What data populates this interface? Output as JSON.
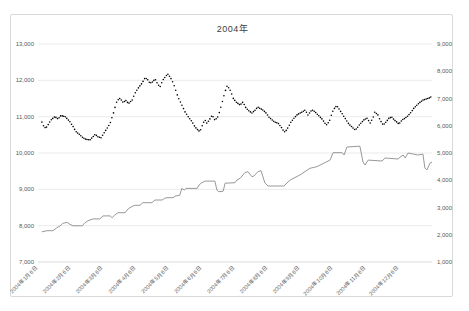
{
  "window": {
    "title": "2004年"
  },
  "colors": {
    "background": "#ffffff",
    "frame_border": "#d9d9d9",
    "gridline": "#e2e2e2",
    "axis_line": "#c8c8c8",
    "axis_text": "#595959",
    "series_black": "#000000",
    "series_gray": "#8c8c8c"
  },
  "chart_data": {
    "type": "line",
    "title": "2004年",
    "legend": "none",
    "grid": "horizontal",
    "x_axis": {
      "labels": [
        "2004年1月6日",
        "2004年2月6日",
        "2004年3月6日",
        "2004年4月6日",
        "2004年5月6日",
        "2004年6月6日",
        "2004年7月6日",
        "2004年8月6日",
        "2004年9月6日",
        "2004年10月6日",
        "2004年11月6日",
        "2004年12月6日"
      ],
      "rotation": -45
    },
    "y_axis_left": {
      "min": 7000,
      "max": 13000,
      "step": 1000,
      "tick_labels": [
        "13,000",
        "12,000",
        "11,000",
        "10,000",
        "9,000",
        "8,000",
        "7,000"
      ]
    },
    "y_axis_right": {
      "min": 1000,
      "max": 9000,
      "step": 1000,
      "tick_labels": [
        "9,000",
        "8,000",
        "7,000",
        "6,000",
        "5,000",
        "4,000",
        "3,000",
        "2,000",
        "1,000"
      ]
    },
    "series": [
      {
        "name": "black-dotted-daily-series",
        "axis": "left",
        "style": "dots",
        "color": "#000000",
        "keypoints": [
          [
            0.01,
            10850
          ],
          [
            0.015,
            10725
          ],
          [
            0.02,
            10680
          ],
          [
            0.033,
            10910
          ],
          [
            0.043,
            11000
          ],
          [
            0.051,
            10935
          ],
          [
            0.058,
            11030
          ],
          [
            0.069,
            11000
          ],
          [
            0.081,
            10860
          ],
          [
            0.089,
            10725
          ],
          [
            0.096,
            10590
          ],
          [
            0.107,
            10495
          ],
          [
            0.114,
            10420
          ],
          [
            0.122,
            10375
          ],
          [
            0.132,
            10360
          ],
          [
            0.14,
            10450
          ],
          [
            0.145,
            10515
          ],
          [
            0.152,
            10450
          ],
          [
            0.16,
            10420
          ],
          [
            0.17,
            10590
          ],
          [
            0.178,
            10725
          ],
          [
            0.183,
            10815
          ],
          [
            0.19,
            11045
          ],
          [
            0.195,
            11230
          ],
          [
            0.198,
            11370
          ],
          [
            0.203,
            11460
          ],
          [
            0.208,
            11505
          ],
          [
            0.216,
            11395
          ],
          [
            0.226,
            11460
          ],
          [
            0.228,
            11340
          ],
          [
            0.239,
            11460
          ],
          [
            0.246,
            11645
          ],
          [
            0.254,
            11780
          ],
          [
            0.264,
            11920
          ],
          [
            0.272,
            12075
          ],
          [
            0.279,
            12010
          ],
          [
            0.284,
            11920
          ],
          [
            0.292,
            11965
          ],
          [
            0.297,
            12040
          ],
          [
            0.305,
            11875
          ],
          [
            0.31,
            11830
          ],
          [
            0.317,
            12010
          ],
          [
            0.327,
            12150
          ],
          [
            0.33,
            12170
          ],
          [
            0.34,
            12010
          ],
          [
            0.348,
            11780
          ],
          [
            0.355,
            11550
          ],
          [
            0.365,
            11320
          ],
          [
            0.373,
            11135
          ],
          [
            0.381,
            11000
          ],
          [
            0.391,
            10860
          ],
          [
            0.398,
            10725
          ],
          [
            0.406,
            10630
          ],
          [
            0.411,
            10590
          ],
          [
            0.419,
            10815
          ],
          [
            0.424,
            10905
          ],
          [
            0.429,
            10815
          ],
          [
            0.437,
            10950
          ],
          [
            0.442,
            11045
          ],
          [
            0.449,
            10905
          ],
          [
            0.457,
            11000
          ],
          [
            0.462,
            11180
          ],
          [
            0.47,
            11500
          ],
          [
            0.475,
            11700
          ],
          [
            0.48,
            11840
          ],
          [
            0.485,
            11780
          ],
          [
            0.49,
            11680
          ],
          [
            0.495,
            11510
          ],
          [
            0.503,
            11400
          ],
          [
            0.513,
            11320
          ],
          [
            0.52,
            11400
          ],
          [
            0.528,
            11240
          ],
          [
            0.536,
            11155
          ],
          [
            0.543,
            11100
          ],
          [
            0.551,
            11180
          ],
          [
            0.558,
            11265
          ],
          [
            0.571,
            11180
          ],
          [
            0.579,
            11100
          ],
          [
            0.586,
            10990
          ],
          [
            0.594,
            10910
          ],
          [
            0.601,
            10850
          ],
          [
            0.609,
            10825
          ],
          [
            0.617,
            10715
          ],
          [
            0.622,
            10630
          ],
          [
            0.627,
            10575
          ],
          [
            0.634,
            10690
          ],
          [
            0.642,
            10850
          ],
          [
            0.65,
            10960
          ],
          [
            0.657,
            11045
          ],
          [
            0.665,
            11100
          ],
          [
            0.67,
            11125
          ],
          [
            0.678,
            11180
          ],
          [
            0.685,
            11045
          ],
          [
            0.693,
            11155
          ],
          [
            0.698,
            11180
          ],
          [
            0.706,
            11100
          ],
          [
            0.713,
            11020
          ],
          [
            0.721,
            10935
          ],
          [
            0.728,
            10825
          ],
          [
            0.733,
            10770
          ],
          [
            0.741,
            10910
          ],
          [
            0.746,
            11100
          ],
          [
            0.754,
            11265
          ],
          [
            0.759,
            11290
          ],
          [
            0.766,
            11180
          ],
          [
            0.774,
            11045
          ],
          [
            0.782,
            10910
          ],
          [
            0.789,
            10795
          ],
          [
            0.797,
            10715
          ],
          [
            0.805,
            10630
          ],
          [
            0.812,
            10715
          ],
          [
            0.817,
            10795
          ],
          [
            0.822,
            10850
          ],
          [
            0.827,
            10910
          ],
          [
            0.835,
            10960
          ],
          [
            0.843,
            10825
          ],
          [
            0.85,
            10960
          ],
          [
            0.855,
            11125
          ],
          [
            0.863,
            11045
          ],
          [
            0.868,
            10910
          ],
          [
            0.876,
            10770
          ],
          [
            0.883,
            10850
          ],
          [
            0.891,
            10960
          ],
          [
            0.898,
            10990
          ],
          [
            0.904,
            10910
          ],
          [
            0.911,
            10850
          ],
          [
            0.916,
            10795
          ],
          [
            0.924,
            10910
          ],
          [
            0.932,
            10960
          ],
          [
            0.939,
            11020
          ],
          [
            0.947,
            11125
          ],
          [
            0.954,
            11235
          ],
          [
            0.962,
            11320
          ],
          [
            0.97,
            11400
          ],
          [
            0.977,
            11455
          ],
          [
            0.985,
            11485
          ],
          [
            0.992,
            11510
          ],
          [
            0.997,
            11540
          ]
        ]
      },
      {
        "name": "gray-solid-line-series",
        "axis": "right",
        "style": "line",
        "color": "#8c8c8c",
        "keypoints": [
          [
            0.01,
            2110
          ],
          [
            0.023,
            2150
          ],
          [
            0.038,
            2150
          ],
          [
            0.048,
            2260
          ],
          [
            0.056,
            2320
          ],
          [
            0.063,
            2420
          ],
          [
            0.074,
            2455
          ],
          [
            0.081,
            2385
          ],
          [
            0.089,
            2330
          ],
          [
            0.112,
            2330
          ],
          [
            0.119,
            2440
          ],
          [
            0.127,
            2515
          ],
          [
            0.14,
            2580
          ],
          [
            0.157,
            2580
          ],
          [
            0.165,
            2690
          ],
          [
            0.183,
            2690
          ],
          [
            0.188,
            2625
          ],
          [
            0.195,
            2725
          ],
          [
            0.203,
            2810
          ],
          [
            0.221,
            2810
          ],
          [
            0.226,
            2910
          ],
          [
            0.233,
            2990
          ],
          [
            0.241,
            3055
          ],
          [
            0.246,
            3080
          ],
          [
            0.259,
            3080
          ],
          [
            0.266,
            3175
          ],
          [
            0.289,
            3175
          ],
          [
            0.297,
            3275
          ],
          [
            0.315,
            3275
          ],
          [
            0.322,
            3340
          ],
          [
            0.327,
            3360
          ],
          [
            0.343,
            3360
          ],
          [
            0.348,
            3420
          ],
          [
            0.36,
            3450
          ],
          [
            0.365,
            3705
          ],
          [
            0.371,
            3640
          ],
          [
            0.376,
            3700
          ],
          [
            0.404,
            3700
          ],
          [
            0.409,
            3825
          ],
          [
            0.414,
            3890
          ],
          [
            0.421,
            3945
          ],
          [
            0.424,
            3970
          ],
          [
            0.449,
            3970
          ],
          [
            0.454,
            3640
          ],
          [
            0.459,
            3580
          ],
          [
            0.47,
            3600
          ],
          [
            0.475,
            3890
          ],
          [
            0.5,
            3910
          ],
          [
            0.505,
            4010
          ],
          [
            0.513,
            4070
          ],
          [
            0.525,
            4280
          ],
          [
            0.533,
            4315
          ],
          [
            0.543,
            4130
          ],
          [
            0.548,
            4155
          ],
          [
            0.558,
            4315
          ],
          [
            0.566,
            4350
          ],
          [
            0.576,
            3900
          ],
          [
            0.584,
            3790
          ],
          [
            0.624,
            3790
          ],
          [
            0.64,
            4010
          ],
          [
            0.665,
            4195
          ],
          [
            0.69,
            4440
          ],
          [
            0.708,
            4500
          ],
          [
            0.733,
            4680
          ],
          [
            0.741,
            4740
          ],
          [
            0.749,
            5010
          ],
          [
            0.772,
            5010
          ],
          [
            0.777,
            4925
          ],
          [
            0.784,
            5220
          ],
          [
            0.817,
            5250
          ],
          [
            0.825,
            4670
          ],
          [
            0.83,
            4560
          ],
          [
            0.838,
            4740
          ],
          [
            0.873,
            4705
          ],
          [
            0.881,
            4815
          ],
          [
            0.914,
            4780
          ],
          [
            0.919,
            4850
          ],
          [
            0.927,
            4925
          ],
          [
            0.932,
            4815
          ],
          [
            0.939,
            5000
          ],
          [
            0.964,
            4925
          ],
          [
            0.977,
            4960
          ],
          [
            0.982,
            4450
          ],
          [
            0.987,
            4375
          ],
          [
            0.995,
            4630
          ],
          [
            1.0,
            4670
          ]
        ]
      }
    ]
  }
}
